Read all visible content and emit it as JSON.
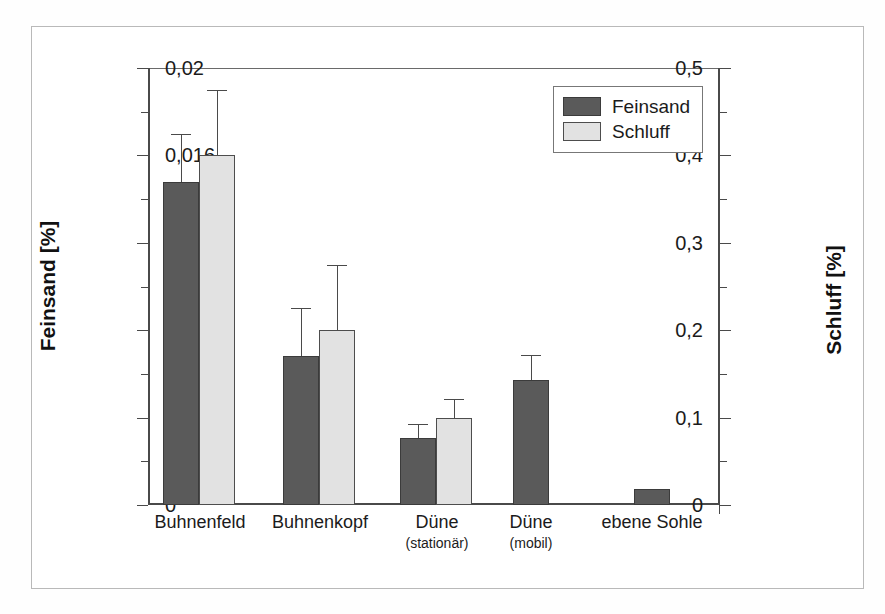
{
  "chart_data": {
    "type": "bar",
    "title": "",
    "subtitle": "",
    "xlabel": "",
    "ylabel": "Feinsand [%]",
    "y2label": "Schluff [%]",
    "grid": false,
    "legend_position": "top-right",
    "categories": [
      "Buhnenfeld",
      "Buhnenkopf",
      "Düne",
      "Düne",
      "ebene Sohle"
    ],
    "category_sublabels": [
      "",
      "",
      "(stationär)",
      "(mobil)",
      ""
    ],
    "ylim": [
      0,
      0.5
    ],
    "y2lim": [
      0,
      0.02
    ],
    "yticks": [
      "0",
      "0,1",
      "0,2",
      "0,3",
      "0,4",
      "0,5"
    ],
    "ytick_values": [
      0,
      0.1,
      0.2,
      0.3,
      0.4,
      0.5
    ],
    "yminor_values": [
      0.05,
      0.15,
      0.25,
      0.35,
      0.45
    ],
    "y2ticks": [
      "0",
      "0,004",
      "0,008",
      "0,012",
      "0,016",
      "0,02"
    ],
    "y2tick_values": [
      0,
      0.004,
      0.008,
      0.012,
      0.016,
      0.02
    ],
    "y2minor_values": [
      0.002,
      0.006,
      0.01,
      0.014,
      0.018
    ],
    "series": [
      {
        "name": "Feinsand",
        "axis": "left",
        "color": "#5a5a5a",
        "values": [
          0.37,
          0.17,
          0.077,
          0.143,
          0.018
        ],
        "errors": [
          0.055,
          0.055,
          0.016,
          0.029,
          0.0
        ]
      },
      {
        "name": "Schluff",
        "axis": "right",
        "color": "#e2e2e2",
        "values": [
          0.016,
          0.008,
          0.004,
          null,
          null
        ],
        "values_left_scale": [
          0.4,
          0.2,
          0.1,
          null,
          null
        ],
        "errors_left_scale": [
          0.075,
          0.075,
          0.021,
          null,
          null
        ]
      }
    ]
  },
  "legend": {
    "entries": [
      {
        "label": "Feinsand",
        "swatch": "dark-gray-swatch"
      },
      {
        "label": "Schluff",
        "swatch": "light-gray-swatch"
      }
    ]
  },
  "axes": {
    "left_title": "Feinsand [%]",
    "right_title": "Schluff [%]"
  }
}
